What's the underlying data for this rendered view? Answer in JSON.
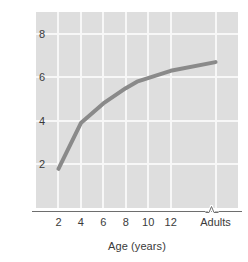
{
  "chart_data": {
    "type": "line",
    "title": "",
    "subtitle": "",
    "xlabel": "Age (years)",
    "ylabel": "Digit span",
    "grid": true,
    "legend": false,
    "legend_position": "none",
    "line_color": "#8a8a8a",
    "plot_background": "#dedede",
    "gridline_color": "#f7f7f7",
    "axis_color": "#6e6e6e",
    "text_color": "#3a3a3a",
    "page_background": "#ffffff",
    "axis_break": "∿",
    "axis_break_note": "x-axis break between age 12 and Adults",
    "xtick_labels": [
      "2",
      "4",
      "6",
      "8",
      "10",
      "12",
      "Adults"
    ],
    "xtick_values": [
      2,
      4,
      6,
      8,
      10,
      12,
      16
    ],
    "ytick_labels": [
      "2",
      "4",
      "6",
      "8"
    ],
    "ytick_values": [
      2,
      4,
      6,
      8
    ],
    "xlim": [
      0,
      18
    ],
    "ylim": [
      0,
      9
    ],
    "x": [
      2,
      4,
      6,
      8,
      9,
      12,
      16
    ],
    "y": [
      1.8,
      3.9,
      4.8,
      5.5,
      5.8,
      6.3,
      6.7
    ],
    "series": [
      {
        "name": "Digit span",
        "points": [
          {
            "x": 2,
            "x_label": "2",
            "y": 1.8
          },
          {
            "x": 4,
            "x_label": "4",
            "y": 3.9
          },
          {
            "x": 6,
            "x_label": "6",
            "y": 4.8
          },
          {
            "x": 8,
            "x_label": "8",
            "y": 5.5
          },
          {
            "x": 9,
            "x_label": "9",
            "y": 5.8
          },
          {
            "x": 12,
            "x_label": "12",
            "y": 6.3
          },
          {
            "x": 16,
            "x_label": "Adults",
            "y": 6.7
          }
        ]
      }
    ]
  }
}
